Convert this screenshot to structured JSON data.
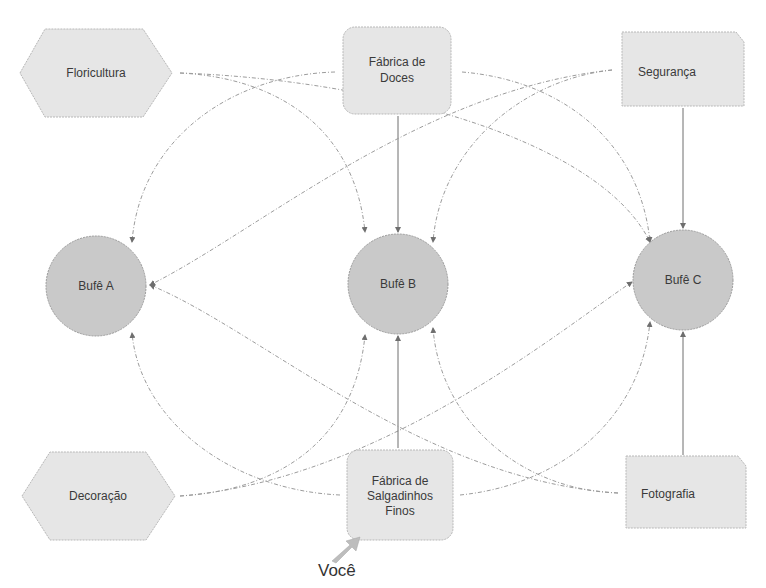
{
  "diagram": {
    "suppliers_top": [
      {
        "id": "floricultura",
        "label_lines": [
          "Floricultura"
        ],
        "shape": "hexagon"
      },
      {
        "id": "fabrica-doces",
        "label_lines": [
          "Fábrica de",
          "Doces"
        ],
        "shape": "rounded-rect"
      },
      {
        "id": "seguranca",
        "label_lines": [
          "Segurança"
        ],
        "shape": "cut-corner-rect"
      }
    ],
    "buffets": [
      {
        "id": "bufe-a",
        "label": "Bufê A",
        "shape": "circle"
      },
      {
        "id": "bufe-b",
        "label": "Bufê B",
        "shape": "circle"
      },
      {
        "id": "bufe-c",
        "label": "Bufê C",
        "shape": "circle"
      }
    ],
    "suppliers_bottom": [
      {
        "id": "decoracao",
        "label_lines": [
          "Decoração"
        ],
        "shape": "hexagon"
      },
      {
        "id": "fabrica-salgadinhos",
        "label_lines": [
          "Fábrica de",
          "Salgadinhos",
          "Finos"
        ],
        "shape": "rounded-rect"
      },
      {
        "id": "fotografia",
        "label_lines": [
          "Fotografia"
        ],
        "shape": "cut-corner-rect"
      }
    ],
    "you_marker": {
      "label": "Você",
      "points_to": "fabrica-salgadinhos",
      "icon": "arrow-icon"
    },
    "edges": [
      {
        "from": "floricultura",
        "to": "bufe-b",
        "style": "dashed"
      },
      {
        "from": "floricultura",
        "to": "bufe-c",
        "style": "dashed"
      },
      {
        "from": "fabrica-doces",
        "to": "bufe-a",
        "style": "dashed"
      },
      {
        "from": "fabrica-doces",
        "to": "bufe-b",
        "style": "solid"
      },
      {
        "from": "fabrica-doces",
        "to": "bufe-c",
        "style": "dashed"
      },
      {
        "from": "seguranca",
        "to": "bufe-a",
        "style": "dashed"
      },
      {
        "from": "seguranca",
        "to": "bufe-b",
        "style": "dashed"
      },
      {
        "from": "seguranca",
        "to": "bufe-c",
        "style": "solid"
      },
      {
        "from": "decoracao",
        "to": "bufe-b",
        "style": "dashed"
      },
      {
        "from": "decoracao",
        "to": "bufe-c",
        "style": "dashed"
      },
      {
        "from": "fabrica-salgadinhos",
        "to": "bufe-a",
        "style": "dashed"
      },
      {
        "from": "fabrica-salgadinhos",
        "to": "bufe-b",
        "style": "solid"
      },
      {
        "from": "fabrica-salgadinhos",
        "to": "bufe-c",
        "style": "dashed"
      },
      {
        "from": "fotografia",
        "to": "bufe-a",
        "style": "dashed"
      },
      {
        "from": "fotografia",
        "to": "bufe-b",
        "style": "dashed"
      },
      {
        "from": "fotografia",
        "to": "bufe-c",
        "style": "solid"
      }
    ],
    "colors": {
      "supplier_fill": "#e6e6e6",
      "buffet_fill": "#c9c9c9",
      "edge": "#9c9c9c",
      "text": "#3a3a3a",
      "you_arrow": "#bdbdbd"
    }
  }
}
